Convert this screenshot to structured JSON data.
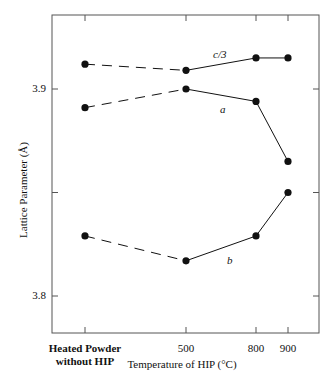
{
  "chart_data": {
    "type": "line",
    "title": "",
    "xlabel": "Temperature of HIP (°C)",
    "ylabel": "Lattice Parameter (Å)",
    "categories": [
      "Heated Powder without HIP",
      "500",
      "800",
      "900"
    ],
    "x_tick_labels": {
      "heated_line1": "Heated Powder",
      "heated_line2": "without HIP",
      "t500": "500",
      "t800": "800",
      "t900": "900"
    },
    "y_tick_labels": {
      "t39": "3.9",
      "t38": "3.8"
    },
    "yticks": [
      3.8,
      3.85,
      3.9
    ],
    "ylim": [
      3.782,
      3.936
    ],
    "grid": false,
    "legend": "inline labels",
    "series": [
      {
        "name": "c/3",
        "values": [
          3.912,
          3.909,
          3.915,
          3.915
        ],
        "first_segment": "dashed"
      },
      {
        "name": "a",
        "values": [
          3.891,
          3.9,
          3.894,
          3.865
        ],
        "first_segment": "dashed"
      },
      {
        "name": "b",
        "values": [
          3.829,
          3.817,
          3.829,
          3.85
        ],
        "first_segment": "dashed"
      }
    ],
    "colors": {
      "line": "#111111",
      "marker": "#111111",
      "axis": "#444444"
    }
  }
}
